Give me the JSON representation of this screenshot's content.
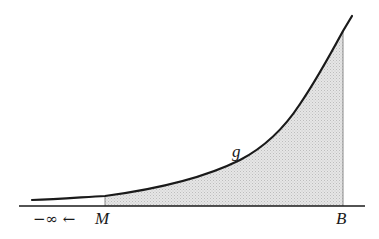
{
  "diagram": {
    "curve_label": "g",
    "left_label_prefix": "−∞ ←",
    "left_bound_label": "M",
    "right_bound_label": "B",
    "colors": {
      "curve": "#1a1a1a",
      "axis": "#1a1a1a",
      "fill": "#d9d9d9",
      "bound_lines": "#8a8a8a"
    }
  }
}
